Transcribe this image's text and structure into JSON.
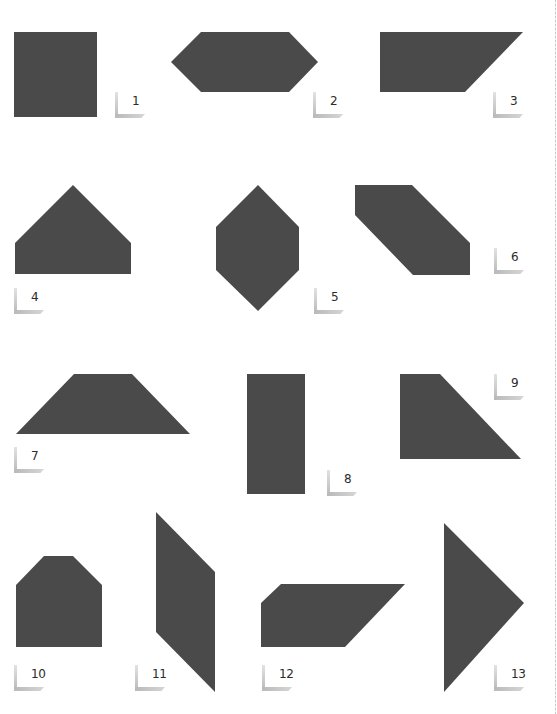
{
  "page": {
    "background": "#ffffff",
    "shape_fill": "#4a4a4a",
    "marker_color": "#c0c0c0"
  },
  "shapes": [
    {
      "id": 1,
      "label": "1",
      "name": "square",
      "points": "14,32 97,32 97,117 14,117",
      "marker": {
        "x": 115,
        "y": 92
      }
    },
    {
      "id": 2,
      "label": "2",
      "name": "elongated-hexagon",
      "points": "171,62 201,32 289,32 318,62 289,92 201,92",
      "marker": {
        "x": 313,
        "y": 92
      }
    },
    {
      "id": 3,
      "label": "3",
      "name": "right-trapezoid",
      "points": "380,32 523,32 465,92 380,92",
      "marker": {
        "x": 493,
        "y": 92
      }
    },
    {
      "id": 4,
      "label": "4",
      "name": "pentagon-house",
      "points": "15,243 73,185 131,243 131,274 15,274",
      "marker": {
        "x": 14,
        "y": 288
      }
    },
    {
      "id": 5,
      "label": "5",
      "name": "vertical-hexagon",
      "points": "216,227 258,185 299,227 299,270 258,311 216,270",
      "marker": {
        "x": 314,
        "y": 288
      }
    },
    {
      "id": 6,
      "label": "6",
      "name": "slanted-hexagon",
      "points": "355,185 412,185 470,243 470,275 413,275 355,215",
      "marker": {
        "x": 494,
        "y": 248
      }
    },
    {
      "id": 7,
      "label": "7",
      "name": "isosceles-trapezoid",
      "points": "16,434 74,374 132,374 190,434",
      "marker": {
        "x": 14,
        "y": 447
      }
    },
    {
      "id": 8,
      "label": "8",
      "name": "tall-rectangle",
      "points": "247,374 305,374 305,494 247,494",
      "marker": {
        "x": 327,
        "y": 470
      }
    },
    {
      "id": 9,
      "label": "9",
      "name": "right-trapezoid",
      "points": "400,374 440,374 521,459 400,459",
      "marker": {
        "x": 494,
        "y": 374
      }
    },
    {
      "id": 10,
      "label": "10",
      "name": "chamfered-pentagon",
      "points": "16,585 44,556 73,556 102,585 102,647 16,647",
      "marker": {
        "x": 14,
        "y": 665
      }
    },
    {
      "id": 11,
      "label": "11",
      "name": "tall-parallelogram",
      "points": "156,512 215,572 215,692 156,632",
      "marker": {
        "x": 135,
        "y": 665
      }
    },
    {
      "id": 12,
      "label": "12",
      "name": "wide-trapezoid",
      "points": "261,603 281,584 405,584 345,647 261,647",
      "marker": {
        "x": 262,
        "y": 665
      }
    },
    {
      "id": 13,
      "label": "13",
      "name": "triangle",
      "points": "444,523 524,603 444,692",
      "marker": {
        "x": 494,
        "y": 665
      }
    }
  ]
}
